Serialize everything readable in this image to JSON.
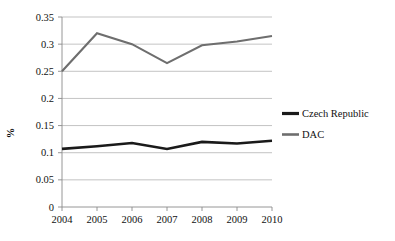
{
  "chart_data": {
    "type": "line",
    "title": "",
    "xlabel": "",
    "ylabel": "%",
    "categories": [
      "2004",
      "2005",
      "2006",
      "2007",
      "2008",
      "2009",
      "2010"
    ],
    "x": [
      2004,
      2005,
      2006,
      2007,
      2008,
      2009,
      2010
    ],
    "ylim": [
      0,
      0.35
    ],
    "yticks": [
      0,
      0.05,
      0.1,
      0.15,
      0.2,
      0.25,
      0.3,
      0.35
    ],
    "ytick_labels": [
      "0",
      "0.05",
      "0.1",
      "0.15",
      "0.2",
      "0.25",
      "0.3",
      "0.35"
    ],
    "grid": true,
    "legend_position": "right",
    "series": [
      {
        "name": "Czech Republic",
        "color": "#1a1a1a",
        "line_width": 2.6,
        "values": [
          0.107,
          0.112,
          0.118,
          0.107,
          0.12,
          0.117,
          0.122
        ]
      },
      {
        "name": "DAC",
        "color": "#6e6e6e",
        "line_width": 2.1,
        "values": [
          0.25,
          0.32,
          0.3,
          0.265,
          0.298,
          0.305,
          0.315
        ]
      }
    ]
  },
  "legend": {
    "items": [
      {
        "label": "Czech Republic",
        "color": "#1a1a1a"
      },
      {
        "label": "DAC",
        "color": "#6e6e6e"
      }
    ]
  },
  "axes": {
    "y_title": "%"
  }
}
